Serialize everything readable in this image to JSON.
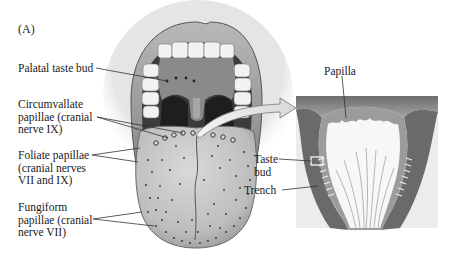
{
  "figure": {
    "panel_label": "(A)",
    "labels": {
      "palatal_taste_bud": "Palatal taste bud",
      "circumvallate": "Circumvallate\npapillae (cranial\nnerve IX)",
      "foliate": "Foliate papillae\n(cranial nerves\nVII and IX)",
      "fungiform": "Fungiform\npapillae (cranial\nnerve VII)",
      "papilla": "Papilla",
      "taste_bud": "Taste\nbud",
      "trench": "Trench"
    },
    "colors": {
      "line": "#3a3a3a",
      "tongue": "#c9c9c9",
      "mouth_dark": "#3a3a3a",
      "lip": "#9a9a9a",
      "section_bg": "#e8e8e8"
    }
  }
}
